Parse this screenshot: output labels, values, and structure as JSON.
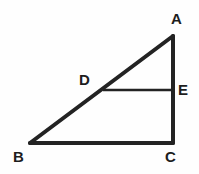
{
  "figure": {
    "kind": "geometry-diagram",
    "background_color": "#fefefe",
    "stroke_color": "#232323",
    "label_color": "#1d1d1d",
    "thick_stroke_width": 4,
    "thin_stroke_width": 2.6,
    "canvas": {
      "width": 199,
      "height": 174
    },
    "points": {
      "A": {
        "label": "A",
        "x": 173,
        "y": 36
      },
      "B": {
        "label": "B",
        "x": 30,
        "y": 143
      },
      "C": {
        "label": "C",
        "x": 173,
        "y": 143
      },
      "D": {
        "label": "D",
        "x": 103,
        "y": 90
      },
      "E": {
        "label": "E",
        "x": 173,
        "y": 90
      }
    },
    "segments": [
      {
        "name": "hypotenuse-BA",
        "from": "B",
        "to": "A",
        "weight": "thick"
      },
      {
        "name": "base-BC",
        "from": "B",
        "to": "C",
        "weight": "thick"
      },
      {
        "name": "leg-AC",
        "from": "A",
        "to": "C",
        "weight": "thick"
      },
      {
        "name": "segment-DE",
        "from": "D",
        "to": "E",
        "weight": "thin"
      }
    ]
  }
}
